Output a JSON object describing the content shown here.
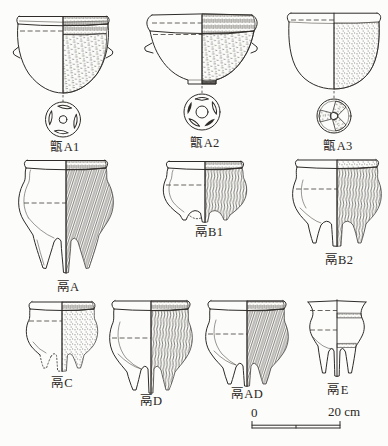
{
  "figure": {
    "type": "archaeological-pottery-typology-plate",
    "ink_color": "#2e2b28",
    "background_color": "#fcfcfa",
    "vessels": [
      {
        "label": "甑A1"
      },
      {
        "label": "甑A2"
      },
      {
        "label": "甑A3"
      },
      {
        "label": "鬲A"
      },
      {
        "label": "鬲B1"
      },
      {
        "label": "鬲B2"
      },
      {
        "label": "鬲C"
      },
      {
        "label": "鬲D"
      },
      {
        "label": "鬲AD"
      },
      {
        "label": "鬲E"
      }
    ],
    "scale_bar": {
      "start_label": "0",
      "end_label": "20 cm"
    }
  }
}
